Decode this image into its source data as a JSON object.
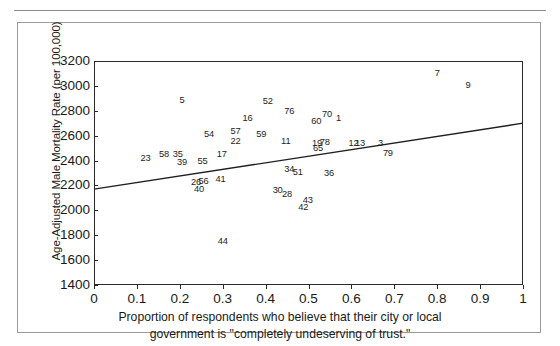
{
  "figure": {
    "ylabel": "Age-Adjusted Male Mortality Rate (per 100,000)",
    "xlabel_line1": "Proportion of respondents who believe that their city or local",
    "xlabel_line2": "government is \"completely undeserving of trust.\""
  },
  "chart_data": {
    "type": "scatter",
    "title": "",
    "subtitle": "",
    "xlabel": "Proportion of respondents who believe that their city or local government is \"completely undeserving of trust.\"",
    "ylabel": "Age-Adjusted Male Mortality Rate (per 100,000)",
    "xlim": [
      0,
      1
    ],
    "ylim": [
      1400,
      3200
    ],
    "xticks": [
      "0",
      "0.1",
      "0.2",
      "0.3",
      "0.4",
      "0.5",
      "0.6",
      "0.7",
      "0.8",
      "0.9",
      "1"
    ],
    "xtick_values": [
      0,
      0.1,
      0.2,
      0.3,
      0.4,
      0.5,
      0.6,
      0.7,
      0.8,
      0.9,
      1
    ],
    "yticks": [
      "1400",
      "1600",
      "1800",
      "2000",
      "2200",
      "2400",
      "2600",
      "2800",
      "3000",
      "3200"
    ],
    "ytick_values": [
      1400,
      1600,
      1800,
      2000,
      2200,
      2400,
      2600,
      2800,
      3000,
      3200
    ],
    "grid": false,
    "legend": "none",
    "marker_style": "numeric-label",
    "trendline": {
      "type": "linear",
      "x": [
        0,
        1
      ],
      "y": [
        2170,
        2700
      ]
    },
    "points": [
      {
        "label": "5",
        "x": 0.205,
        "y": 2890
      },
      {
        "label": "52",
        "x": 0.405,
        "y": 2880
      },
      {
        "label": "7",
        "x": 0.8,
        "y": 3100
      },
      {
        "label": "9",
        "x": 0.872,
        "y": 3010
      },
      {
        "label": "76",
        "x": 0.455,
        "y": 2800
      },
      {
        "label": "16",
        "x": 0.358,
        "y": 2745
      },
      {
        "label": "70",
        "x": 0.543,
        "y": 2775
      },
      {
        "label": "1",
        "x": 0.57,
        "y": 2740
      },
      {
        "label": "60",
        "x": 0.518,
        "y": 2720
      },
      {
        "label": "54",
        "x": 0.268,
        "y": 2615
      },
      {
        "label": "57",
        "x": 0.33,
        "y": 2640
      },
      {
        "label": "59",
        "x": 0.39,
        "y": 2615
      },
      {
        "label": "22",
        "x": 0.33,
        "y": 2555
      },
      {
        "label": "11",
        "x": 0.447,
        "y": 2560
      },
      {
        "label": "19",
        "x": 0.52,
        "y": 2545
      },
      {
        "label": "78",
        "x": 0.538,
        "y": 2550
      },
      {
        "label": "65",
        "x": 0.522,
        "y": 2500
      },
      {
        "label": "12",
        "x": 0.605,
        "y": 2540
      },
      {
        "label": "13",
        "x": 0.62,
        "y": 2540
      },
      {
        "label": "3",
        "x": 0.668,
        "y": 2540
      },
      {
        "label": "17",
        "x": 0.298,
        "y": 2450
      },
      {
        "label": "23",
        "x": 0.12,
        "y": 2420
      },
      {
        "label": "58",
        "x": 0.163,
        "y": 2450
      },
      {
        "label": "35",
        "x": 0.195,
        "y": 2455
      },
      {
        "label": "39",
        "x": 0.205,
        "y": 2390
      },
      {
        "label": "55",
        "x": 0.253,
        "y": 2395
      },
      {
        "label": "79",
        "x": 0.685,
        "y": 2460
      },
      {
        "label": "34",
        "x": 0.455,
        "y": 2330
      },
      {
        "label": "51",
        "x": 0.475,
        "y": 2305
      },
      {
        "label": "36",
        "x": 0.548,
        "y": 2300
      },
      {
        "label": "26",
        "x": 0.238,
        "y": 2230
      },
      {
        "label": "56",
        "x": 0.255,
        "y": 2235
      },
      {
        "label": "41",
        "x": 0.295,
        "y": 2255
      },
      {
        "label": "40",
        "x": 0.245,
        "y": 2175
      },
      {
        "label": "30",
        "x": 0.428,
        "y": 2165
      },
      {
        "label": "28",
        "x": 0.45,
        "y": 2135
      },
      {
        "label": "43",
        "x": 0.498,
        "y": 2085
      },
      {
        "label": "42",
        "x": 0.488,
        "y": 2030
      },
      {
        "label": "44",
        "x": 0.3,
        "y": 1750
      }
    ]
  }
}
